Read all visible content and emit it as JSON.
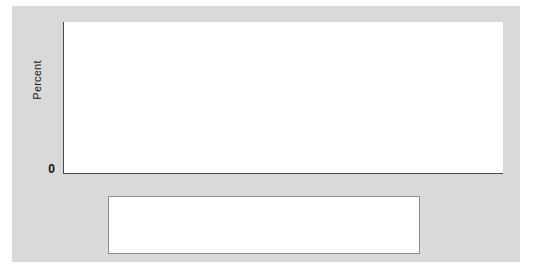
{
  "figure": {
    "background_color": "#d9d9d9",
    "plot_background_color": "#ffffff",
    "axis_color": "#4a4a4a"
  },
  "axes": {
    "ylabel": "Percent",
    "yticks": [
      "0",
      "5",
      "10",
      "15",
      "20",
      "25",
      "30",
      "35"
    ],
    "xticks": [
      "2010",
      "2011",
      "2012",
      "2013",
      "2014",
      "2015",
      "2016",
      "2017"
    ]
  },
  "legend": {
    "items": [
      {
        "label": "White",
        "marker": "triangle-down",
        "color": "#6e6e6e"
      },
      {
        "label": "Black",
        "marker": "triangle-up",
        "color": "#c4c4c4"
      },
      {
        "label": "Hispanic",
        "marker": "circle",
        "color": "#333333"
      },
      {
        "label": "Asian/Native Hawaiian and Pacific Islander",
        "marker": "diamond",
        "color": "#2b2b2b"
      },
      {
        "label": "American Indian/Alaska Native",
        "marker": "square",
        "color": "#a8a8a8"
      },
      {
        "label": "Multiple Races",
        "marker": "x-cross",
        "color": "#1a1a1a"
      }
    ]
  },
  "bottom_note": "",
  "chart_data": {
    "type": "line",
    "title": "",
    "xlabel": "",
    "ylabel": "Percent",
    "x": [
      2010,
      2011,
      2012,
      2013,
      2014,
      2015,
      2016,
      2017
    ],
    "categories": [
      "2010",
      "2011",
      "2012",
      "2013",
      "2014",
      "2015",
      "2016",
      "2017"
    ],
    "ylim": [
      0,
      35
    ],
    "yticks": [
      0,
      5,
      10,
      15,
      20,
      25,
      30,
      35
    ],
    "grid": false,
    "legend_position": "bottom",
    "series": [
      {
        "name": "White",
        "marker": "triangle-down",
        "color": "#6e6e6e",
        "values": [
          13.3,
          13.3,
          13.2,
          12.9,
          9.9,
          7.7,
          7.7,
          7.6
        ]
      },
      {
        "name": "Black",
        "marker": "triangle-up",
        "color": "#c4c4c4",
        "values": [
          19.9,
          19.0,
          19.0,
          19.0,
          14.9,
          11.6,
          10.9,
          10.6
        ]
      },
      {
        "name": "Hispanic",
        "marker": "circle",
        "color": "#333333",
        "values": [
          32.9,
          30.8,
          30.9,
          30.0,
          24.7,
          20.6,
          18.7,
          18.6
        ]
      },
      {
        "name": "Asian/Native Hawaiian and Pacific Islander",
        "marker": "diamond",
        "color": "#2b2b2b",
        "values": [
          17.0,
          16.8,
          16.3,
          16.2,
          10.5,
          7.8,
          6.8,
          6.7
        ]
      },
      {
        "name": "American Indian/Alaska Native",
        "marker": "square",
        "color": "#a8a8a8",
        "values": [
          32.0,
          30.3,
          30.1,
          30.0,
          25.8,
          22.7,
          21.3,
          21.3
        ]
      },
      {
        "name": "Multiple Races",
        "marker": "x-cross",
        "color": "#1a1a1a",
        "values": [
          15.2,
          14.0,
          13.8,
          13.8,
          10.4,
          7.8,
          7.7,
          7.6
        ]
      }
    ]
  }
}
